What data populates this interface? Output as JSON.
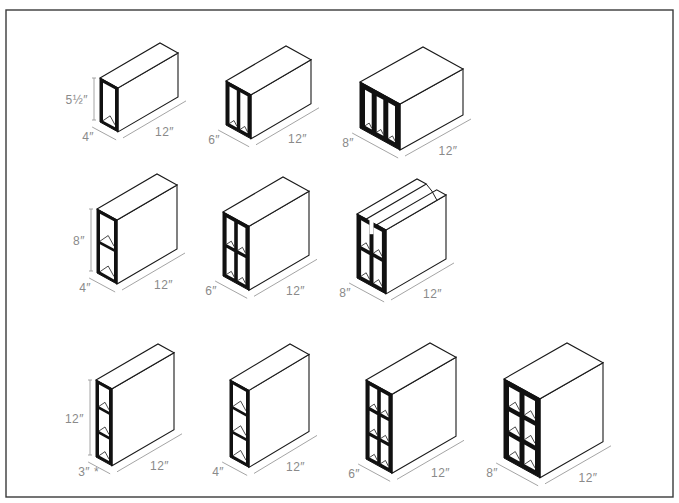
{
  "colors": {
    "background": "#ffffff",
    "frame": "#3a3a3a",
    "outline": "#1a1a1a",
    "web": "#111111",
    "dimension": "#9a9a9a",
    "label": "#8a8a8a"
  },
  "frame": {
    "x": 6,
    "y": 10,
    "w": 667,
    "h": 487
  },
  "blocks": [
    {
      "id": "b1",
      "row": 1,
      "height_label": "5½″",
      "width_label": "4″",
      "length_label": "12″",
      "cols": 1,
      "rows": 1,
      "type": "standard",
      "x": 100,
      "y": 122,
      "w": 18,
      "h": 44,
      "dx": 60,
      "dy": -35
    },
    {
      "id": "b2",
      "row": 1,
      "height_label": "",
      "width_label": "6″",
      "length_label": "12″",
      "cols": 2,
      "rows": 1,
      "type": "standard",
      "x": 226,
      "y": 125,
      "w": 25,
      "h": 44,
      "dx": 60,
      "dy": -35
    },
    {
      "id": "b3",
      "row": 1,
      "height_label": "",
      "width_label": "8″",
      "length_label": "12″",
      "cols": 3,
      "rows": 1,
      "type": "standard",
      "x": 360,
      "y": 128,
      "w": 40,
      "h": 46,
      "dx": 63,
      "dy": -35
    },
    {
      "id": "b4",
      "row": 2,
      "height_label": "8″",
      "width_label": "4″",
      "length_label": "12″",
      "cols": 1,
      "rows": 2,
      "type": "standard",
      "x": 97,
      "y": 273,
      "w": 20,
      "h": 64,
      "dx": 60,
      "dy": -35
    },
    {
      "id": "b5",
      "row": 2,
      "height_label": "",
      "width_label": "6″",
      "length_label": "12″",
      "cols": 2,
      "rows": 2,
      "type": "standard",
      "x": 223,
      "y": 276,
      "w": 26,
      "h": 64,
      "dx": 60,
      "dy": -35
    },
    {
      "id": "b6",
      "row": 2,
      "height_label": "",
      "width_label": "8″",
      "length_label": "12″",
      "cols": 2,
      "rows": 2,
      "type": "bond-beam",
      "x": 357,
      "y": 278,
      "w": 29,
      "h": 64,
      "dx": 60,
      "dy": -35
    },
    {
      "id": "b7",
      "row": 3,
      "height_label": "12″",
      "width_label": "3″ *",
      "length_label": "12″",
      "cols": 1,
      "rows": 3,
      "type": "standard",
      "x": 96,
      "y": 457,
      "w": 16,
      "h": 77,
      "dx": 62,
      "dy": -36
    },
    {
      "id": "b8",
      "row": 3,
      "height_label": "",
      "width_label": "4″",
      "length_label": "12″",
      "cols": 1,
      "rows": 3,
      "type": "standard",
      "x": 230,
      "y": 457,
      "w": 19,
      "h": 77,
      "dx": 60,
      "dy": -36
    },
    {
      "id": "b9",
      "row": 3,
      "height_label": "",
      "width_label": "6″",
      "length_label": "12″",
      "cols": 2,
      "rows": 3,
      "type": "standard",
      "x": 366,
      "y": 459,
      "w": 26,
      "h": 79,
      "dx": 64,
      "dy": -37
    },
    {
      "id": "b10",
      "row": 3,
      "height_label": "",
      "width_label": "8″",
      "length_label": "12″",
      "cols": 2,
      "rows": 3,
      "type": "standard",
      "x": 504,
      "y": 458,
      "w": 36,
      "h": 79,
      "dx": 63,
      "dy": -36
    }
  ]
}
